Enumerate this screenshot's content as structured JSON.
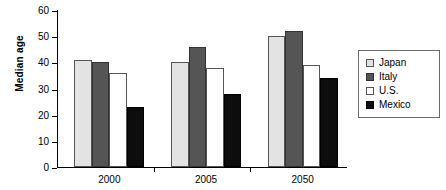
{
  "chart_data": {
    "type": "bar",
    "title": "",
    "subtitle": "",
    "xlabel": "",
    "ylabel": "Median age",
    "categories": [
      "2000",
      "2005",
      "2050"
    ],
    "series": [
      {
        "name": "Japan",
        "color": "#e3e3e3",
        "values": [
          41,
          40,
          50
        ]
      },
      {
        "name": "Italy",
        "color": "#555555",
        "values": [
          40,
          46,
          52
        ]
      },
      {
        "name": "U.S.",
        "color": "#ffffff",
        "values": [
          36,
          38,
          39
        ]
      },
      {
        "name": "Mexico",
        "color": "#0d0d0d",
        "values": [
          23,
          28,
          34
        ]
      }
    ],
    "ylim": [
      0,
      60
    ],
    "yticks": [
      0,
      10,
      20,
      30,
      40,
      50,
      60
    ],
    "ytick_labels": [
      "0",
      "10",
      "20",
      "30",
      "40",
      "50",
      "60"
    ],
    "grid": false,
    "legend_position": "right",
    "legend_entries": [
      "Japan",
      "Italy",
      "U.S.",
      "Mexico"
    ]
  }
}
